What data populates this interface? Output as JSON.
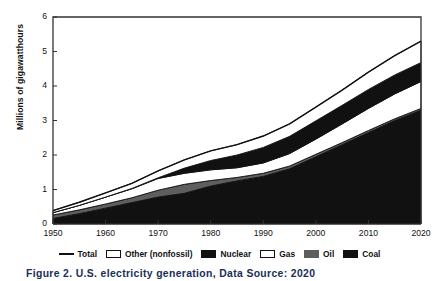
{
  "figure": {
    "caption": "Figure 2.  U.S. electricity generation, Data Source: 2020"
  },
  "chart_data": {
    "type": "area",
    "title": "",
    "subtitle": "",
    "xlabel": "",
    "ylabel": "Millions of gigawatthours",
    "xlim": [
      1950,
      2020
    ],
    "ylim": [
      0,
      6
    ],
    "grid": false,
    "stacked": true,
    "legend_position": "bottom",
    "x": [
      1950,
      1955,
      1960,
      1965,
      1970,
      1975,
      1980,
      1985,
      1990,
      1995,
      2000,
      2005,
      2010,
      2015,
      2020
    ],
    "xticks": [
      1950,
      1960,
      1970,
      1980,
      1990,
      2000,
      2010,
      2020
    ],
    "yticks": [
      0,
      1,
      2,
      3,
      4,
      5,
      6
    ],
    "series": [
      {
        "name": "Coal",
        "color": "#111111",
        "values": [
          0.16,
          0.3,
          0.46,
          0.62,
          0.78,
          0.89,
          1.1,
          1.25,
          1.38,
          1.6,
          1.95,
          2.3,
          2.65,
          3.0,
          3.3
        ]
      },
      {
        "name": "Oil",
        "color": "#5e5e5e",
        "values": [
          0.1,
          0.11,
          0.12,
          0.14,
          0.2,
          0.26,
          0.16,
          0.1,
          0.09,
          0.08,
          0.07,
          0.06,
          0.06,
          0.05,
          0.05
        ]
      },
      {
        "name": "Gas",
        "color": "#ffffff",
        "values": [
          0.07,
          0.13,
          0.2,
          0.26,
          0.34,
          0.32,
          0.31,
          0.28,
          0.3,
          0.36,
          0.44,
          0.54,
          0.64,
          0.72,
          0.78
        ]
      },
      {
        "name": "Nuclear",
        "color": "#111111",
        "values": [
          0.0,
          0.0,
          0.0,
          0.01,
          0.02,
          0.15,
          0.27,
          0.37,
          0.45,
          0.5,
          0.53,
          0.54,
          0.55,
          0.55,
          0.55
        ]
      },
      {
        "name": "Other (nonfossil)",
        "color": "#ffffff",
        "values": [
          0.06,
          0.09,
          0.12,
          0.15,
          0.2,
          0.24,
          0.28,
          0.3,
          0.33,
          0.36,
          0.4,
          0.44,
          0.5,
          0.56,
          0.62
        ]
      }
    ],
    "total": {
      "name": "Total",
      "color": "#111111",
      "values": [
        0.39,
        0.63,
        0.9,
        1.18,
        1.54,
        1.86,
        2.12,
        2.3,
        2.55,
        2.9,
        3.39,
        3.88,
        4.4,
        4.88,
        5.3
      ]
    },
    "legend": [
      {
        "label": "Total",
        "marker": "line",
        "color": "#111111"
      },
      {
        "label": "Other (nonfossil)",
        "marker": "box",
        "color": "#ffffff"
      },
      {
        "label": "Nuclear",
        "marker": "box",
        "color": "#111111"
      },
      {
        "label": "Gas",
        "marker": "box",
        "color": "#ffffff"
      },
      {
        "label": "Oil",
        "marker": "box",
        "color": "#5e5e5e"
      },
      {
        "label": "Coal",
        "marker": "box",
        "color": "#111111"
      }
    ]
  }
}
